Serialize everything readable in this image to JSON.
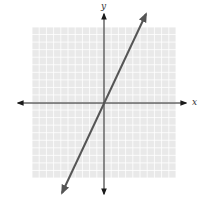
{
  "chart_data": {
    "type": "line",
    "title": "",
    "xlabel": "x",
    "ylabel": "y",
    "xlim": [
      -10,
      10
    ],
    "ylim": [
      -10,
      10
    ],
    "grid": true,
    "grid_step": 1,
    "series": [
      {
        "name": "y = 2x",
        "equation": "y = 2x",
        "slope": 2,
        "intercept": 0,
        "x": [
          -6,
          0,
          6
        ],
        "values": [
          -12,
          0,
          12
        ],
        "arrows_both_ends": true
      }
    ],
    "axes_arrows": true
  },
  "colors": {
    "grid_background": "#e9e9e9",
    "grid_line": "#ffffff",
    "axis": "#1a1a1a",
    "line": "#555555"
  },
  "labels": {
    "x_axis": "x",
    "y_axis": "y"
  }
}
